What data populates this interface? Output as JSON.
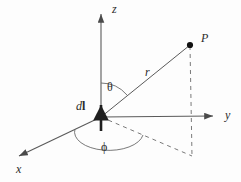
{
  "figure": {
    "background_color": "#fdfdfd",
    "line_color": "#555555",
    "text_color": "#2b2b2b"
  },
  "labels": {
    "z_axis": "z",
    "y_axis": "y",
    "x_axis": "x",
    "point_p": "P",
    "radius": "r",
    "theta": "θ",
    "phi": "ϕ",
    "current_element_prefix": "d",
    "current_element_vector": "l"
  },
  "geometry": {
    "origin": {
      "x": 101,
      "y": 117
    },
    "z_axis_tip": {
      "x": 101,
      "y": 10
    },
    "y_axis_tip": {
      "x": 219,
      "y": 116
    },
    "x_axis_tip": {
      "x": 13,
      "y": 159
    },
    "point_p": {
      "x": 190,
      "y": 45
    },
    "projection_point": {
      "x": 192,
      "y": 156
    },
    "dl_arrow_base": {
      "x": 101,
      "y": 131
    },
    "dl_arrow_tip": {
      "x": 101,
      "y": 101
    }
  },
  "annotations": {
    "theta_description": "polar angle between z-axis and radius r",
    "phi_description": "azimuthal angle measured from x-axis in the xy-plane",
    "dashed_description": "dashed projection lines from P to the xy-plane"
  }
}
